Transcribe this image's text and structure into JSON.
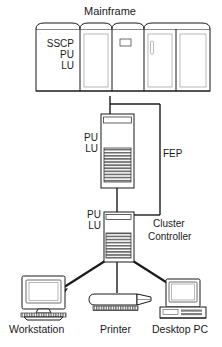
{
  "diagram": {
    "type": "network-topology-diagram",
    "background_color": "#ffffff",
    "line_color": "#1a1a1a",
    "fill_color": "#ffffff",
    "shade_color": "#8c8c8c"
  },
  "mainframe": {
    "label": "Mainframe",
    "stack_lines": [
      "SSCP",
      "PU",
      "LU"
    ],
    "stack_text": "SSCP\nPU\nLU",
    "panel_count": 5
  },
  "fep": {
    "label": "FEP",
    "stack_lines": [
      "PU",
      "LU"
    ],
    "stack_text": "PU\nLU"
  },
  "cluster_controller": {
    "label_line1": "Cluster",
    "label_line2": "Controller",
    "stack_lines": [
      "PU",
      "LU"
    ],
    "stack_text": "PU\nLU"
  },
  "devices": [
    {
      "id": "workstation",
      "label": "Workstation",
      "icon": "crt-terminal-icon"
    },
    {
      "id": "printer",
      "label": "Printer",
      "icon": "printer-icon"
    },
    {
      "id": "desktop-pc",
      "label": "Desktop PC",
      "icon": "desktop-computer-icon"
    }
  ],
  "links": [
    {
      "from": "mainframe",
      "to": "fep"
    },
    {
      "from": "mainframe",
      "to": "cluster-controller"
    },
    {
      "from": "fep",
      "to": "cluster-controller"
    },
    {
      "from": "cluster-controller",
      "to": "workstation"
    },
    {
      "from": "cluster-controller",
      "to": "printer"
    },
    {
      "from": "cluster-controller",
      "to": "desktop-pc"
    }
  ]
}
